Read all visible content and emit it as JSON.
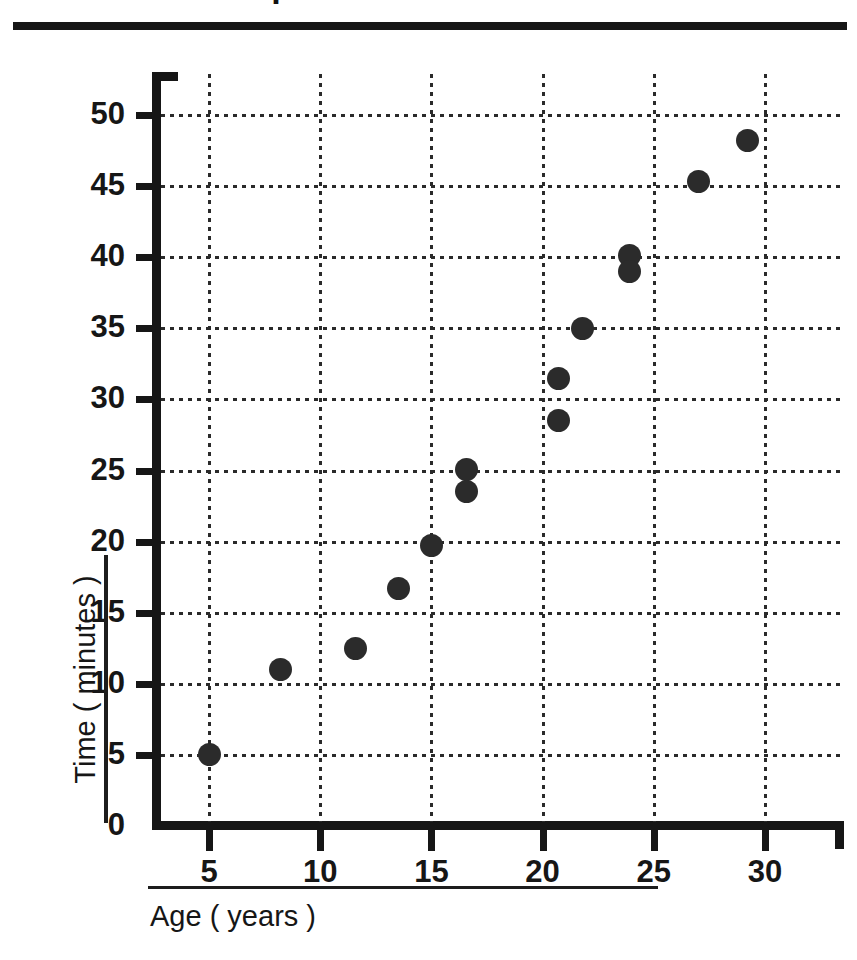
{
  "header": {
    "title_fragment": "Sample",
    "rule_visible": true
  },
  "chart_data": {
    "type": "scatter",
    "title": "",
    "xlabel": "Age ( years )",
    "ylabel": "Time ( minutes )",
    "xlim": [
      3.0,
      31.8
    ],
    "ylim": [
      0,
      53
    ],
    "xticks": [
      5,
      10,
      15,
      20,
      25,
      30
    ],
    "yticks": [
      0,
      5,
      10,
      15,
      20,
      25,
      30,
      35,
      40,
      45,
      50
    ],
    "xtick_labels": [
      "5",
      "10",
      "15",
      "20",
      "25",
      "30"
    ],
    "ytick_labels": [
      "0",
      "5",
      "10",
      "15",
      "20",
      "25",
      "30",
      "35",
      "40",
      "45",
      "50"
    ],
    "grid": true,
    "grid_style": "dotted",
    "legend": null,
    "marker": "filled-circle",
    "marker_color": "#2b2b2b",
    "marker_size": 23,
    "points": [
      {
        "x": 5.0,
        "y": 5.0
      },
      {
        "x": 8.2,
        "y": 11.0
      },
      {
        "x": 11.6,
        "y": 12.5
      },
      {
        "x": 13.5,
        "y": 16.7
      },
      {
        "x": 15.0,
        "y": 19.7
      },
      {
        "x": 16.6,
        "y": 25.1
      },
      {
        "x": 16.6,
        "y": 23.5
      },
      {
        "x": 20.7,
        "y": 31.5
      },
      {
        "x": 20.7,
        "y": 28.5
      },
      {
        "x": 21.8,
        "y": 35.0
      },
      {
        "x": 23.9,
        "y": 40.1
      },
      {
        "x": 23.9,
        "y": 39.0
      },
      {
        "x": 27.0,
        "y": 45.3
      },
      {
        "x": 29.2,
        "y": 48.2
      }
    ]
  },
  "colors": {
    "axis": "#161616",
    "grid": "#2a2a2a",
    "marker": "#2b2b2b",
    "background": "#ffffff"
  }
}
